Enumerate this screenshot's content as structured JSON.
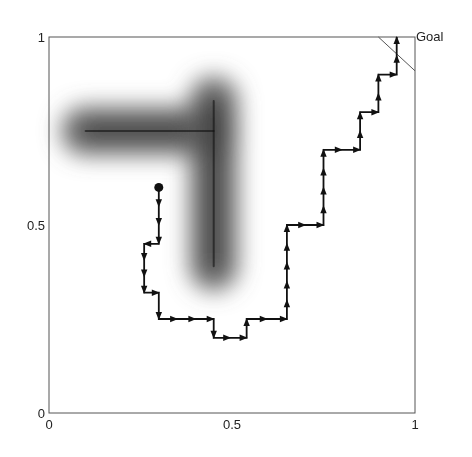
{
  "chart_data": {
    "type": "line",
    "title": "",
    "xlabel": "",
    "ylabel": "",
    "xlim": [
      0,
      1
    ],
    "ylim": [
      0,
      1
    ],
    "x_ticks": [
      "0",
      "0.5",
      "1"
    ],
    "y_ticks": [
      "0",
      "0.5",
      "1"
    ],
    "grid": false,
    "legend": null,
    "annotations": [
      {
        "text": "Goal",
        "x": 1.0,
        "y": 1.0
      }
    ],
    "obstacle": {
      "description": "blurred L-shaped dark obstacle (potential field)",
      "segments": [
        {
          "from": [
            0.1,
            0.75
          ],
          "to": [
            0.45,
            0.75
          ]
        },
        {
          "from": [
            0.45,
            0.83
          ],
          "to": [
            0.45,
            0.39
          ]
        }
      ],
      "color": "#000000"
    },
    "goal_region": {
      "from": [
        0.9,
        1.0
      ],
      "to": [
        1.0,
        0.91
      ]
    },
    "series": [
      {
        "name": "robot path",
        "color": "#111111",
        "start": [
          0.3,
          0.6
        ],
        "points": [
          [
            0.3,
            0.6
          ],
          [
            0.3,
            0.45
          ],
          [
            0.26,
            0.45
          ],
          [
            0.26,
            0.32
          ],
          [
            0.3,
            0.32
          ],
          [
            0.3,
            0.25
          ],
          [
            0.45,
            0.25
          ],
          [
            0.45,
            0.2
          ],
          [
            0.54,
            0.2
          ],
          [
            0.54,
            0.25
          ],
          [
            0.65,
            0.25
          ],
          [
            0.65,
            0.5
          ],
          [
            0.75,
            0.5
          ],
          [
            0.75,
            0.7
          ],
          [
            0.85,
            0.7
          ],
          [
            0.85,
            0.8
          ],
          [
            0.9,
            0.8
          ],
          [
            0.9,
            0.9
          ],
          [
            0.95,
            0.9
          ],
          [
            0.95,
            1.0
          ]
        ]
      }
    ]
  }
}
